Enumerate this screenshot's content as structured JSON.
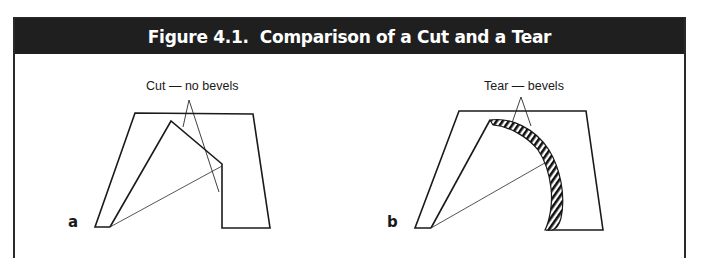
{
  "figure": {
    "title": "Figure 4.1.  Comparison of a Cut and a Tear",
    "header_color": "#1f1f1f",
    "title_color": "#ffffff"
  },
  "panels": [
    {
      "id": "a",
      "label": "a",
      "caption": "Cut — no bevels",
      "edge_type": "cut",
      "bevels": false
    },
    {
      "id": "b",
      "label": "b",
      "caption": "Tear — bevels",
      "edge_type": "tear",
      "bevels": true,
      "bevel_pattern": "diagonal-hatch"
    }
  ]
}
